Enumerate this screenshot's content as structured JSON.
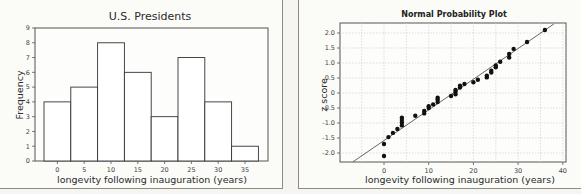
{
  "chart_data": [
    {
      "type": "bar",
      "title": "U.S. Presidents",
      "xlabel": "longevity following inauguration  (years)",
      "ylabel": "Frequency",
      "categories": [
        "0",
        "5",
        "10",
        "15",
        "20",
        "25",
        "30",
        "35"
      ],
      "values": [
        4,
        5,
        8,
        6,
        3,
        7,
        4,
        1
      ],
      "bin_width": 5,
      "yticks": [
        0,
        1,
        2,
        3,
        4,
        5,
        6,
        7,
        8,
        9
      ],
      "ylim": [
        0,
        9
      ],
      "grid": false,
      "bar_fill": "#ffffff",
      "bar_edge": "#333333"
    },
    {
      "type": "scatter",
      "title": "Normal Probability Plot",
      "xlabel": "longevity following inauguration  (years)",
      "ylabel": "z score",
      "xticks": [
        0,
        10,
        20,
        30,
        40
      ],
      "yticks": [
        "2.0",
        "1.5",
        "1.0",
        "0.5",
        "0",
        "-0.5",
        "-1.0",
        "-1.5",
        "-2.0"
      ],
      "xlim": [
        -7,
        41
      ],
      "ylim": [
        -2.3,
        2.3
      ],
      "grid": true,
      "fit_line": {
        "x1": -7,
        "y1": -2.3,
        "x2": 38,
        "y2": 2.3
      },
      "points": [
        [
          0,
          -2.1
        ],
        [
          0,
          -1.7
        ],
        [
          1,
          -1.47
        ],
        [
          2,
          -1.33
        ],
        [
          3,
          -1.2
        ],
        [
          4,
          -1.08
        ],
        [
          4,
          -0.98
        ],
        [
          4,
          -0.9
        ],
        [
          4,
          -0.82
        ],
        [
          7,
          -0.76
        ],
        [
          9,
          -0.68
        ],
        [
          9,
          -0.6
        ],
        [
          10,
          -0.5
        ],
        [
          10,
          -0.44
        ],
        [
          11,
          -0.38
        ],
        [
          12,
          -0.3
        ],
        [
          12,
          -0.22
        ],
        [
          12,
          -0.16
        ],
        [
          15,
          -0.1
        ],
        [
          16,
          -0.04
        ],
        [
          16,
          0.04
        ],
        [
          16,
          0.1
        ],
        [
          17,
          0.18
        ],
        [
          17,
          0.24
        ],
        [
          18,
          0.3
        ],
        [
          20,
          0.36
        ],
        [
          21,
          0.44
        ],
        [
          23,
          0.52
        ],
        [
          23,
          0.58
        ],
        [
          24,
          0.68
        ],
        [
          24,
          0.74
        ],
        [
          25,
          0.86
        ],
        [
          25,
          0.92
        ],
        [
          26,
          1.04
        ],
        [
          28,
          1.18
        ],
        [
          28,
          1.3
        ],
        [
          29,
          1.47
        ],
        [
          32,
          1.7
        ],
        [
          36,
          2.1
        ]
      ]
    }
  ]
}
